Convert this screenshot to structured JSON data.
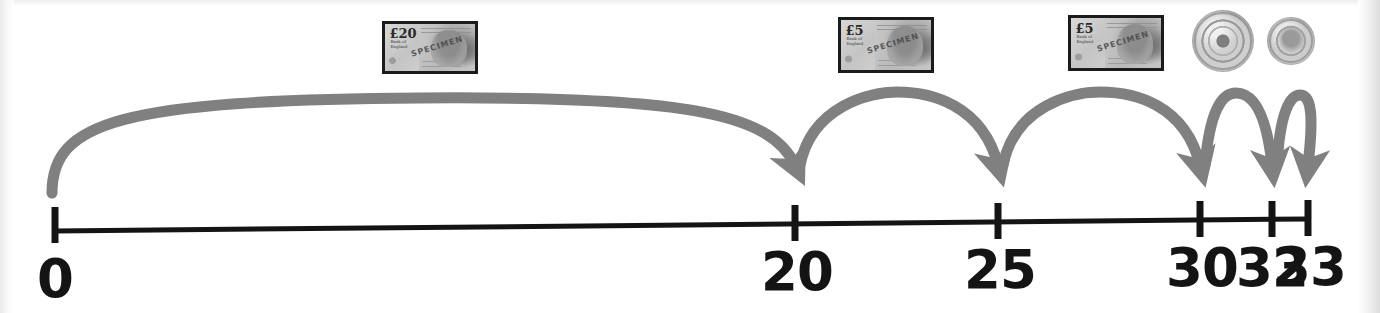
{
  "figure": {
    "kind": "number-line-jumps",
    "colors": {
      "line": "#141414",
      "arc": "#808080",
      "label": "#141414",
      "background": "#ffffff"
    }
  },
  "number_line": {
    "start_value": 0,
    "end_value": 33,
    "ticks": [
      {
        "value": 0,
        "label": "0",
        "x": 55,
        "label_x": 55,
        "has_label": true
      },
      {
        "value": 20,
        "label": "20",
        "x": 795,
        "label_x": 797,
        "has_label": true
      },
      {
        "value": 25,
        "label": "25",
        "x": 998,
        "label_x": 1000,
        "has_label": true
      },
      {
        "value": 30,
        "label": "30",
        "x": 1200,
        "label_x": 1202,
        "has_label": true
      },
      {
        "value": 32,
        "label": "32",
        "x": 1272,
        "label_x": 1272,
        "has_label": true
      },
      {
        "value": 33,
        "label": "33",
        "x": 1308,
        "label_x": 1310,
        "has_label": true
      }
    ],
    "axis_y": 222,
    "tick_height": 34,
    "label_y": 243
  },
  "jumps": [
    {
      "id": "jump-20",
      "from": 0,
      "to": 20,
      "amount": 20,
      "label": "£20",
      "money": "note-20"
    },
    {
      "id": "jump-5-first",
      "from": 20,
      "to": 25,
      "amount": 5,
      "label": "£5",
      "money": "note-5-a"
    },
    {
      "id": "jump-5-second",
      "from": 25,
      "to": 30,
      "amount": 5,
      "label": "£5",
      "money": "note-5-b"
    },
    {
      "id": "jump-2",
      "from": 30,
      "to": 32,
      "amount": 2,
      "label": "£2",
      "money": "coin-2"
    },
    {
      "id": "jump-1",
      "from": 32,
      "to": 33,
      "amount": 1,
      "label": "£1",
      "money": "coin-1"
    }
  ],
  "money_items": [
    {
      "id": "note-20",
      "type": "banknote",
      "denomination": "£20",
      "denom_text": "£20",
      "sub_text": "Bank of England",
      "overprint": "SPECIMEN",
      "x": 382,
      "y": 21,
      "w": 96,
      "h": 53
    },
    {
      "id": "note-5-a",
      "type": "banknote",
      "denomination": "£5",
      "denom_text": "£5",
      "sub_text": "Bank of England",
      "overprint": "SPECIMEN",
      "x": 838,
      "y": 17,
      "w": 96,
      "h": 56
    },
    {
      "id": "note-5-b",
      "type": "banknote",
      "denomination": "£5",
      "denom_text": "£5",
      "sub_text": "Bank of England",
      "overprint": "SPECIMEN",
      "x": 1068,
      "y": 15,
      "w": 96,
      "h": 56
    },
    {
      "id": "coin-2",
      "type": "coin",
      "denomination": "£2",
      "x": 1192,
      "y": 10,
      "size": 62
    },
    {
      "id": "coin-1",
      "type": "coin",
      "denomination": "£1",
      "x": 1267,
      "y": 17,
      "size": 48
    }
  ]
}
